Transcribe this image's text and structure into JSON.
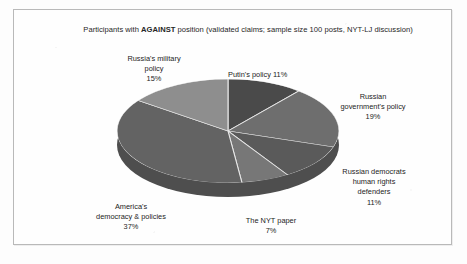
{
  "chart_data": {
    "type": "pie",
    "title": "Participants with AGAINST position (validated claims; sample size 100 posts, NYT-LJ discussion)",
    "title_prefix": "Participants with ",
    "title_emphasis": "AGAINST",
    "title_suffix": " position (validated claims; sample size 100 posts, NYT-LJ discussion)",
    "xlabel": "",
    "ylabel": "",
    "legend": "none",
    "grid": false,
    "units": "percent",
    "categories": [
      "Putin's policy",
      "Russian government's policy",
      "Russian democrats human rights defenders",
      "The NYT paper",
      "America's democracy & policies",
      "Russia's military policy"
    ],
    "values": [
      11,
      19,
      11,
      7,
      37,
      15
    ],
    "colors": [
      "#4a4a4a",
      "#6e6e6e",
      "#5a5a5a",
      "#777777",
      "#636363",
      "#8e8e8e"
    ],
    "labels": [
      {
        "key": "putin",
        "text": "Putin's policy 11%",
        "value": 11,
        "color": "#4a4a4a"
      },
      {
        "key": "govt",
        "text": "Russian\ngovernment's policy\n19%",
        "value": 19,
        "color": "#6e6e6e"
      },
      {
        "key": "democrats",
        "text": "Russian democrats\nhuman rights\ndefenders\n11%",
        "value": 11,
        "color": "#5a5a5a"
      },
      {
        "key": "nyt",
        "text": "The NYT paper\n7%",
        "value": 7,
        "color": "#777777"
      },
      {
        "key": "america",
        "text": "America's\ndemocracy & policies\n37%",
        "value": 37,
        "color": "#636363"
      },
      {
        "key": "military",
        "text": "Russia's military\npolicy\n15%",
        "value": 15,
        "color": "#8e8e8e"
      }
    ],
    "style": {
      "three_d": true,
      "depth_color": "#4e4e4e",
      "separator_color": "#e8e8e8",
      "frame_color": "#b9b9b9",
      "background": "#fefefe"
    }
  }
}
